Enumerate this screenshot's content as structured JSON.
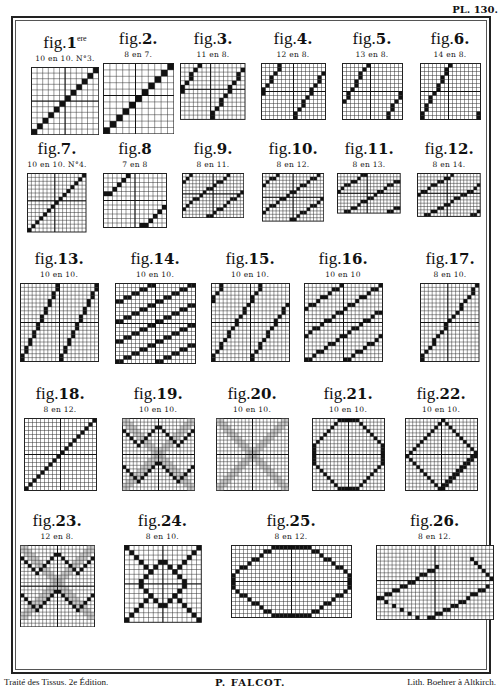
{
  "plate": {
    "number": "PL. 130."
  },
  "footer": {
    "left": "Traité des Tissus. 2e Édition.",
    "center": "P. FALCOT.",
    "right": "Lith. Boehrer à Altkirch."
  },
  "figures": [
    {
      "id": "1",
      "label": "fig.",
      "num": "1",
      "sup": "ere",
      "sub": "10 en 10. N°3.",
      "x": 30,
      "y": 30,
      "cols": 12,
      "rows": 12,
      "cw": 5.6,
      "pattern": {
        "type": "diag",
        "step": 1,
        "rise": 1,
        "period": 12
      }
    },
    {
      "id": "2",
      "label": "fig.",
      "num": "2.",
      "sub": "8 en 7.",
      "x": 103,
      "y": 30,
      "cols": 11,
      "rows": 11,
      "cw": 6.4,
      "pattern": {
        "type": "diag",
        "step": 1,
        "rise": 1,
        "period": 11
      }
    },
    {
      "id": "3",
      "label": "fig.",
      "num": "3.",
      "sub": "11 en 8.",
      "x": 178,
      "y": 30,
      "cols": 15,
      "rows": 13,
      "cw": 4.3,
      "pattern": {
        "type": "diag",
        "step": 1,
        "rise": 1.45,
        "period": 11
      }
    },
    {
      "id": "4",
      "label": "fig.",
      "num": "4.",
      "sub": "12 en 8.",
      "x": 258,
      "y": 30,
      "cols": 16,
      "rows": 14,
      "cw": 4.0,
      "pattern": {
        "type": "diag",
        "step": 1,
        "rise": 1.5,
        "period": 12
      }
    },
    {
      "id": "5",
      "label": "fig.",
      "num": "5.",
      "sub": "13 en 8.",
      "x": 337,
      "y": 30,
      "cols": 15,
      "rows": 14,
      "cw": 4.0,
      "pattern": {
        "type": "diag",
        "step": 1,
        "rise": 1.6,
        "period": 13
      }
    },
    {
      "id": "6",
      "label": "fig.",
      "num": "6.",
      "sub": "14 en 8.",
      "x": 415,
      "y": 30,
      "cols": 15,
      "rows": 14,
      "cw": 4.0,
      "pattern": {
        "type": "diag",
        "step": 1,
        "rise": 1.75,
        "period": 14
      }
    },
    {
      "id": "7",
      "label": "fig.",
      "num": "7.",
      "sub": "10 en 10. N°4.",
      "x": 22,
      "y": 140,
      "cols": 15,
      "rows": 15,
      "cw": 3.9,
      "pattern": {
        "type": "diag",
        "step": 1,
        "rise": 1,
        "period": 15
      }
    },
    {
      "id": "8",
      "label": "fig.",
      "num": "8",
      "sub": "7 en 8",
      "x": 100,
      "y": 140,
      "cols": 14,
      "rows": 12,
      "cw": 4.5,
      "pattern": {
        "type": "diag",
        "step": 1,
        "rise": 0.875,
        "period": 16
      }
    },
    {
      "id": "9",
      "label": "fig.",
      "num": "9.",
      "sub": "8 en 11.",
      "x": 178,
      "y": 140,
      "cols": 18,
      "rows": 13,
      "cw": 3.4,
      "pattern": {
        "type": "diag",
        "step": 1,
        "rise": 0.73,
        "period": 11
      }
    },
    {
      "id": "10",
      "label": "fig.",
      "num": "10.",
      "sub": "8 en 12.",
      "x": 258,
      "y": 140,
      "cols": 18,
      "rows": 14,
      "cw": 3.4,
      "pattern": {
        "type": "diag",
        "step": 1,
        "rise": 0.67,
        "period": 12
      }
    },
    {
      "id": "11",
      "label": "fig.",
      "num": "11.",
      "sub": "8 en 13.",
      "x": 334,
      "y": 140,
      "cols": 19,
      "rows": 12,
      "cw": 3.3,
      "pattern": {
        "type": "diag",
        "step": 1,
        "rise": 0.62,
        "period": 13
      }
    },
    {
      "id": "12",
      "label": "fig.",
      "num": "12.",
      "sub": "8 en 14.",
      "x": 414,
      "y": 140,
      "cols": 19,
      "rows": 13,
      "cw": 3.3,
      "pattern": {
        "type": "diag",
        "step": 1,
        "rise": 0.57,
        "period": 14
      }
    },
    {
      "id": "13",
      "label": "fig.",
      "num": "13.",
      "sub": "10 en 10.",
      "x": 20,
      "y": 250,
      "cols": 20,
      "rows": 20,
      "cw": 3.9,
      "pattern": {
        "type": "diag",
        "step": 1,
        "rise": 2,
        "period": 10
      }
    },
    {
      "id": "14",
      "label": "fig.",
      "num": "14.",
      "sub": "10 en 10.",
      "x": 115,
      "y": 250,
      "cols": 20,
      "rows": 20,
      "cw": 4.0,
      "pattern": {
        "type": "diag",
        "step": 1,
        "rise": 0.5,
        "period": 10
      }
    },
    {
      "id": "15",
      "label": "fig.",
      "num": "15.",
      "sub": "10 en 10.",
      "x": 211,
      "y": 250,
      "cols": 20,
      "rows": 20,
      "cw": 3.9,
      "pattern": {
        "type": "diag",
        "step": 1,
        "rise": 1.5,
        "period": 10
      }
    },
    {
      "id": "16",
      "label": "fig.",
      "num": "16.",
      "sub": "10 en 10",
      "x": 304,
      "y": 250,
      "cols": 20,
      "rows": 20,
      "cw": 3.9,
      "pattern": {
        "type": "diag",
        "step": 1,
        "rise": 0.67,
        "period": 10
      }
    },
    {
      "id": "17",
      "label": "fig.",
      "num": "17.",
      "sub": "8 en 10.",
      "x": 415,
      "y": 250,
      "cols": 15,
      "rows": 20,
      "cw": 3.9,
      "pattern": {
        "type": "diag",
        "step": 1,
        "rise": 1.3,
        "period": 20
      }
    },
    {
      "id": "18",
      "label": "fig.",
      "num": "18.",
      "sub": "8 en 12.",
      "x": 24,
      "y": 385,
      "cols": 18,
      "rows": 18,
      "cw": 4.0,
      "pattern": {
        "type": "diag",
        "step": 1,
        "rise": 1,
        "period": 18
      }
    },
    {
      "id": "19",
      "label": "fig.",
      "num": "19.",
      "sub": "10 en 10.",
      "x": 122,
      "y": 385,
      "cols": 20,
      "rows": 20,
      "cw": 3.6,
      "pattern": {
        "type": "chevron"
      }
    },
    {
      "id": "20",
      "label": "fig.",
      "num": "20.",
      "sub": "10 en 10.",
      "x": 216,
      "y": 385,
      "cols": 20,
      "rows": 20,
      "cw": 3.6,
      "pattern": {
        "type": "cross"
      }
    },
    {
      "id": "21",
      "label": "fig.",
      "num": "21.",
      "sub": "10 en 10.",
      "x": 312,
      "y": 385,
      "cols": 20,
      "rows": 20,
      "cw": 3.6,
      "pattern": {
        "type": "octagon"
      }
    },
    {
      "id": "22",
      "label": "fig.",
      "num": "22.",
      "sub": "10 en 10.",
      "x": 405,
      "y": 385,
      "cols": 20,
      "rows": 20,
      "cw": 3.6,
      "pattern": {
        "type": "rect45"
      }
    },
    {
      "id": "23",
      "label": "fig.",
      "num": "23.",
      "sub": "12 en 8.",
      "x": 20,
      "y": 512,
      "cols": 20,
      "rows": 22,
      "cw": 3.7,
      "pattern": {
        "type": "chevron2"
      }
    },
    {
      "id": "24",
      "label": "fig.",
      "num": "24.",
      "sub": "8 en 10.",
      "x": 124,
      "y": 512,
      "cols": 16,
      "rows": 16,
      "cw": 4.8,
      "pattern": {
        "type": "xdiamond"
      }
    },
    {
      "id": "25",
      "label": "fig.",
      "num": "25.",
      "sub": "8 en 12.",
      "x": 231,
      "y": 512,
      "cols": 30,
      "rows": 18,
      "cw": 4.0,
      "pattern": {
        "type": "hexagon"
      }
    },
    {
      "id": "26",
      "label": "fig.",
      "num": "26.",
      "sub": "8 en 12.",
      "x": 376,
      "y": 512,
      "cols": 30,
      "rows": 19,
      "cw": 3.9,
      "pattern": {
        "type": "rect30"
      }
    }
  ]
}
